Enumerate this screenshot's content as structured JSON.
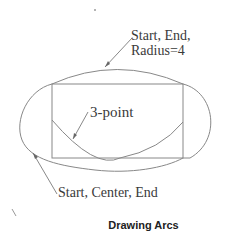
{
  "diagram": {
    "labels": {
      "start_end_radius_line1": "Start, End,",
      "start_end_radius_line2": "Radius=4",
      "three_point": "3-point",
      "start_center_end": "Start, Center, End"
    },
    "caption": "Drawing Arcs",
    "colors": {
      "stroke": "#777777",
      "text": "#3a3a3a"
    }
  }
}
